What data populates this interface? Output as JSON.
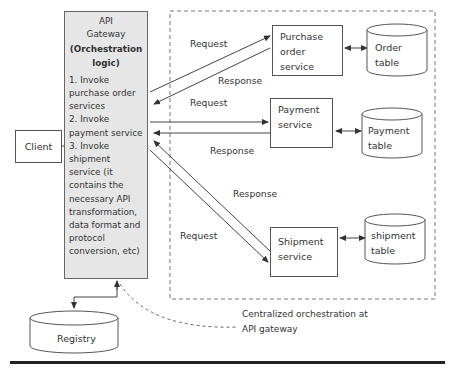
{
  "gateway": {
    "title_line1": "API",
    "title_line2": "Gateway",
    "subtitle_line1": "(Orchestration",
    "subtitle_line2": "logic)",
    "steps": [
      "1. Invoke purchase order services",
      "2. Invoke payment service",
      "3. Invoke shipment service (it contains the necessary API transformation, data format and protocol conversion, etc)"
    ]
  },
  "client": {
    "label": "Client"
  },
  "services": {
    "purchase_order": {
      "line1": "Purchase",
      "line2": "order",
      "line3": "service"
    },
    "payment": {
      "line1": "Payment",
      "line2": "service"
    },
    "shipment": {
      "line1": "Shipment",
      "line2": "service"
    }
  },
  "tables": {
    "order": {
      "line1": "Order",
      "line2": "table"
    },
    "payment": {
      "line1": "Payment",
      "line2": "table"
    },
    "shipment": {
      "line1": "shipment",
      "line2": "table"
    }
  },
  "registry": {
    "label": "Registry"
  },
  "edge_labels": {
    "po_request": "Request",
    "po_response": "Response",
    "pay_request": "Request",
    "pay_response": "Response",
    "ship_response": "Response",
    "ship_request": "Request"
  },
  "note": {
    "line1": "Centralized orchestration at",
    "line2": "API gateway"
  },
  "colors": {
    "gateway_fill": "#e6e6e6",
    "stroke": "#555555",
    "text": "#333333",
    "bottom_rule": "#222222"
  }
}
